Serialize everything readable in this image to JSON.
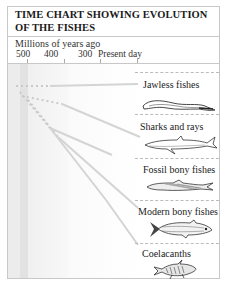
{
  "title": {
    "line1": "TIME CHART SHOWING EVOLUTION",
    "line2": "OF THE FISHES"
  },
  "axis": {
    "label": "Millions of years ago",
    "ticks": [
      {
        "label": "500",
        "x": 27
      },
      {
        "label": "400",
        "x": 64
      },
      {
        "label": "300",
        "x": 100
      },
      {
        "label": "Present day",
        "x": 137
      }
    ]
  },
  "groups": [
    {
      "label": "Jawless fishes",
      "icon": "lamprey-illustration"
    },
    {
      "label": "Sharks and rays",
      "icon": "shark-illustration"
    },
    {
      "label": "Fossil bony fishes",
      "icon": "fossil-fish-illustration"
    },
    {
      "label": "Modern bony fishes",
      "icon": "herring-illustration"
    },
    {
      "label": "Coelacanths",
      "icon": "coelacanth-illustration"
    }
  ],
  "colors": {
    "border": "#c8c8c8",
    "band_dark": "#e4e4e4",
    "band_light": "#f3f3f3",
    "lines": "#d0d0d0",
    "text": "#222222"
  }
}
